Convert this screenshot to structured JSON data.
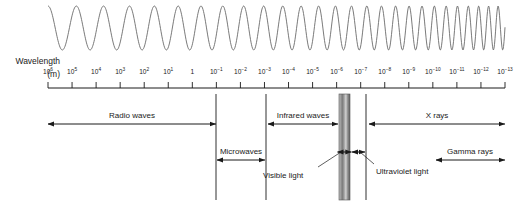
{
  "figure": {
    "background_color": "#ffffff",
    "line_color": "#333333",
    "wave_color": "#6b6b6b"
  },
  "axis": {
    "name_line1": "Wavelength",
    "name_line2": "(m)",
    "unit": "m",
    "x_start_px": 48,
    "x_end_px": 505,
    "tick_spacing_px": 24.05,
    "exponents": [
      6,
      5,
      4,
      3,
      2,
      1,
      0,
      -1,
      -2,
      -3,
      -4,
      -5,
      -6,
      -7,
      -8,
      -9,
      -10,
      -11,
      -12,
      -13
    ],
    "tick_labels": [
      "10⁶",
      "10⁵",
      "10⁴",
      "10³",
      "10²",
      "10¹",
      "1",
      "10⁻¹",
      "10⁻²",
      "10⁻³",
      "10⁻⁴",
      "10⁻⁵",
      "10⁻⁶",
      "10⁻⁷",
      "10⁻⁸",
      "10⁻⁹",
      "10⁻¹⁰",
      "10⁻¹¹",
      "10⁻¹²",
      "10⁻¹³"
    ]
  },
  "bands": [
    {
      "id": "radio-waves",
      "label": "Radio waves",
      "row": 1,
      "arrow_x1": 48,
      "arrow_x2": 216,
      "label_x": 132,
      "label_y": 112,
      "arrow_y": 124
    },
    {
      "id": "microwaves",
      "label": "Microwaves",
      "row": 2,
      "arrow_x1": 217,
      "arrow_x2": 265,
      "label_x": 241,
      "label_y": 148,
      "arrow_y": 160
    },
    {
      "id": "infrared-waves",
      "label": "Infrared waves",
      "row": 1,
      "arrow_x1": 268,
      "arrow_x2": 338,
      "label_x": 303,
      "label_y": 112,
      "arrow_y": 124
    },
    {
      "id": "x-rays",
      "label": "X rays",
      "row": 1,
      "arrow_x1": 369,
      "arrow_x2": 505,
      "label_x": 437,
      "label_y": 112,
      "arrow_y": 124
    },
    {
      "id": "gamma-rays",
      "label": "Gamma rays",
      "row": 2,
      "arrow_x1": 436,
      "arrow_x2": 505,
      "label_x": 470,
      "label_y": 148,
      "arrow_y": 160
    }
  ],
  "dividers": [
    {
      "id": "divider-radio-microwave",
      "x": 216
    },
    {
      "id": "divider-microwave-infrared",
      "x": 266
    },
    {
      "id": "divider-uv-xray",
      "x": 366
    }
  ],
  "visible_light": {
    "label": "Visible light",
    "label_x": 263,
    "label_y": 172,
    "band_x": 339,
    "band_width": 11,
    "band_top": 94,
    "band_bottom": 200,
    "arrow_y": 152,
    "leader_from_x": 318,
    "leader_from_y": 167,
    "leader_to_x": 341,
    "leader_to_y": 152,
    "colors": [
      "#b9b9b9",
      "#9c9c9c",
      "#7d7d7d",
      "#a8a8a8",
      "#cfcfcf",
      "#8e8e8e",
      "#6e6e6e"
    ]
  },
  "ultraviolet_light": {
    "label": "Ultraviolet light",
    "label_x": 376,
    "label_y": 168,
    "arrow_x1": 352,
    "arrow_x2": 365,
    "arrow_y": 152,
    "leader_from_x": 374,
    "leader_from_y": 164,
    "leader_to_x": 360,
    "leader_to_y": 152
  },
  "wave": {
    "x_start": 48,
    "x_end": 505,
    "y_center": 28,
    "amplitude": 22,
    "cycles_start_width": 29,
    "cycles_end_width": 9
  }
}
